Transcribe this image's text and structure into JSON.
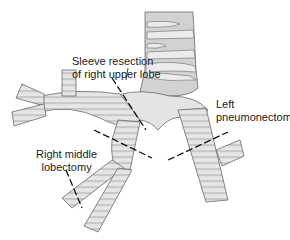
{
  "diagram": {
    "colors": {
      "cartilage_fill": "#e6e6e6",
      "membrane_fill": "#c9c9c9",
      "outline": "#6a6a6a",
      "cut_line": "#111111",
      "background": "#ffffff"
    },
    "labels": [
      {
        "id": "sleeve",
        "lines": [
          "Sleeve resection",
          "of right upper lobe"
        ]
      },
      {
        "id": "left",
        "lines": [
          "Left",
          "pneumonectomy"
        ]
      },
      {
        "id": "middle",
        "lines": [
          "Right middle",
          "lobectomy"
        ]
      }
    ],
    "structures": [
      "trachea",
      "right-main-bronchus",
      "right-upper-lobe-bronchus",
      "bronchus-intermedius",
      "right-middle-lobe-bronchus",
      "right-lower-lobe-bronchus",
      "left-main-bronchus",
      "left-upper-lobe-stub"
    ],
    "cut_lines": [
      "sleeve-upper-cut",
      "sleeve-lower-cut",
      "left-pneumonectomy-cut",
      "middle-lobectomy-cut"
    ]
  }
}
